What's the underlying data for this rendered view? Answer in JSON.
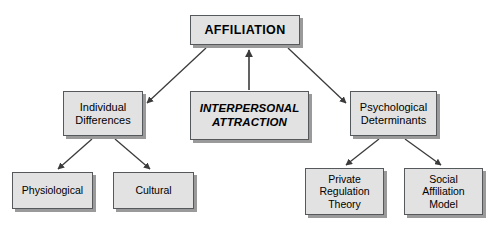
{
  "diagram": {
    "type": "concept-map",
    "background_color": "#ffffff",
    "node_fill_color": "#e2e2e2",
    "node_border_color": "#55595c",
    "node_shadow_color": "#9a9a9a",
    "edge_color": "#3b3b3b",
    "nodes": [
      {
        "id": "affiliation",
        "label": "AFFILIATION",
        "role": "root",
        "x": 190,
        "y": 15,
        "w": 110,
        "h": 30
      },
      {
        "id": "interpersonal-attraction",
        "label": "INTERPERSONAL\nATTRACTION",
        "role": "center",
        "x": 190,
        "y": 91,
        "w": 119,
        "h": 49
      },
      {
        "id": "individual-differences",
        "label": "Individual\nDifferences",
        "role": "branch",
        "x": 63,
        "y": 91,
        "w": 80,
        "h": 45
      },
      {
        "id": "psychological-determinants",
        "label": "Psychological\nDeterminants",
        "role": "branch",
        "x": 350,
        "y": 91,
        "w": 87,
        "h": 45
      },
      {
        "id": "physiological",
        "label": "Physiological",
        "role": "leaf",
        "x": 12,
        "y": 172,
        "w": 81,
        "h": 37
      },
      {
        "id": "cultural",
        "label": "Cultural",
        "role": "leaf",
        "x": 113,
        "y": 172,
        "w": 81,
        "h": 37
      },
      {
        "id": "private-regulation-theory",
        "label": "Private\nRegulation\nTheory",
        "role": "leaf",
        "x": 305,
        "y": 168,
        "w": 79,
        "h": 47
      },
      {
        "id": "social-affiliation-model",
        "label": "Social\nAffiliation\nModel",
        "role": "leaf",
        "x": 404,
        "y": 168,
        "w": 79,
        "h": 47
      }
    ],
    "edges": [
      {
        "id": "attraction-to-affiliation",
        "from": "interpersonal-attraction",
        "to": "affiliation",
        "direction": "up",
        "arrowhead": "end"
      },
      {
        "id": "affiliation-to-individual-differences",
        "from": "affiliation",
        "to": "individual-differences",
        "direction": "down-left",
        "arrowhead": "end"
      },
      {
        "id": "affiliation-to-psychological-determinants",
        "from": "affiliation",
        "to": "psychological-determinants",
        "direction": "down-right",
        "arrowhead": "end"
      },
      {
        "id": "individual-differences-to-physiological",
        "from": "individual-differences",
        "to": "physiological",
        "direction": "down-left",
        "arrowhead": "end"
      },
      {
        "id": "individual-differences-to-cultural",
        "from": "individual-differences",
        "to": "cultural",
        "direction": "down-right",
        "arrowhead": "end"
      },
      {
        "id": "psychological-determinants-to-private-regulation-theory",
        "from": "psychological-determinants",
        "to": "private-regulation-theory",
        "direction": "down-left",
        "arrowhead": "end"
      },
      {
        "id": "psychological-determinants-to-social-affiliation-model",
        "from": "psychological-determinants",
        "to": "social-affiliation-model",
        "direction": "down-right",
        "arrowhead": "end"
      }
    ]
  }
}
